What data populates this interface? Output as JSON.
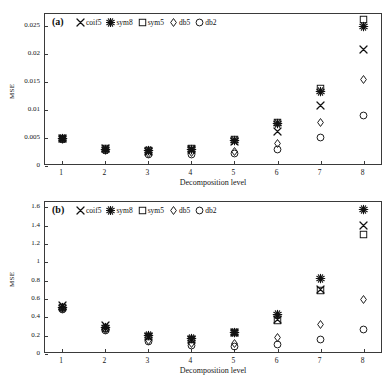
{
  "figure": {
    "xlabel": "Decomposition level",
    "ylabel": "MSE",
    "xticks": [
      "1",
      "2",
      "3",
      "4",
      "5",
      "6",
      "7",
      "8"
    ],
    "series_names": [
      "coif5",
      "sym8",
      "sym5",
      "db5",
      "db2"
    ],
    "markers": [
      "cross",
      "star",
      "square",
      "diamond",
      "circle"
    ]
  },
  "panel_a": {
    "tag": "(a)",
    "yticks": [
      "0",
      "0.005",
      "0.01",
      "0.015",
      "0.02",
      "0.025"
    ]
  },
  "panel_b": {
    "tag": "(b)",
    "yticks": [
      "0",
      "0.2",
      "0.4",
      "0.6",
      "0.8",
      "1",
      "1.2",
      "1.4",
      "1.6"
    ]
  },
  "legend": {
    "items": [
      {
        "label": "coif5",
        "marker": "cross"
      },
      {
        "label": "sym8",
        "marker": "star"
      },
      {
        "label": "sym5",
        "marker": "square"
      },
      {
        "label": "db5",
        "marker": "diamond"
      },
      {
        "label": "db2",
        "marker": "circle"
      }
    ]
  },
  "chart_data": [
    {
      "type": "scatter",
      "panel": "(a)",
      "title": "",
      "xlabel": "Decomposition level",
      "ylabel": "MSE",
      "x": [
        1,
        2,
        3,
        4,
        5,
        6,
        7,
        8
      ],
      "xlim": [
        0.6,
        8.45
      ],
      "ylim": [
        0,
        0.0272
      ],
      "yticks": [
        0,
        0.005,
        0.01,
        0.015,
        0.02,
        0.025
      ],
      "xticks": [
        1,
        2,
        3,
        4,
        5,
        6,
        7,
        8
      ],
      "grid": false,
      "legend_position": "top-left",
      "series": [
        {
          "name": "coif5",
          "marker": "cross",
          "values": [
            0.005,
            0.0031,
            0.0026,
            0.0029,
            0.0043,
            0.0061,
            0.0108,
            0.0208
          ]
        },
        {
          "name": "sym8",
          "marker": "star",
          "values": [
            0.005,
            0.003,
            0.0027,
            0.003,
            0.0046,
            0.0076,
            0.0133,
            0.0249
          ]
        },
        {
          "name": "sym5",
          "marker": "square",
          "values": [
            0.005,
            0.0031,
            0.0027,
            0.0031,
            0.0047,
            0.0077,
            0.0138,
            0.0262
          ]
        },
        {
          "name": "db5",
          "marker": "diamond",
          "values": [
            0.0049,
            0.0029,
            0.0023,
            0.0024,
            0.0026,
            0.0041,
            0.0078,
            0.0155
          ]
        },
        {
          "name": "db2",
          "marker": "circle",
          "values": [
            0.0048,
            0.0028,
            0.002,
            0.002,
            0.0022,
            0.003,
            0.0051,
            0.009
          ]
        }
      ]
    },
    {
      "type": "scatter",
      "panel": "(b)",
      "title": "",
      "xlabel": "Decomposition level",
      "ylabel": "MSE",
      "x": [
        1,
        2,
        3,
        4,
        5,
        6,
        7,
        8
      ],
      "xlim": [
        0.6,
        8.45
      ],
      "ylim": [
        0,
        1.66
      ],
      "yticks": [
        0,
        0.2,
        0.4,
        0.6,
        0.8,
        1.0,
        1.2,
        1.4,
        1.6
      ],
      "xticks": [
        1,
        2,
        3,
        4,
        5,
        6,
        7,
        8
      ],
      "grid": false,
      "legend_position": "top-left",
      "series": [
        {
          "name": "coif5",
          "marker": "cross",
          "values": [
            0.53,
            0.31,
            0.19,
            0.16,
            0.23,
            0.38,
            0.7,
            1.4
          ]
        },
        {
          "name": "sym8",
          "marker": "star",
          "values": [
            0.51,
            0.29,
            0.2,
            0.17,
            0.24,
            0.43,
            0.82,
            1.58
          ]
        },
        {
          "name": "sym5",
          "marker": "square",
          "values": [
            0.51,
            0.28,
            0.19,
            0.16,
            0.23,
            0.37,
            0.69,
            1.3
          ]
        },
        {
          "name": "db5",
          "marker": "diamond",
          "values": [
            0.5,
            0.27,
            0.15,
            0.11,
            0.11,
            0.18,
            0.32,
            0.59
          ]
        },
        {
          "name": "db2",
          "marker": "circle",
          "values": [
            0.49,
            0.26,
            0.14,
            0.09,
            0.08,
            0.1,
            0.16,
            0.27
          ]
        }
      ]
    }
  ]
}
